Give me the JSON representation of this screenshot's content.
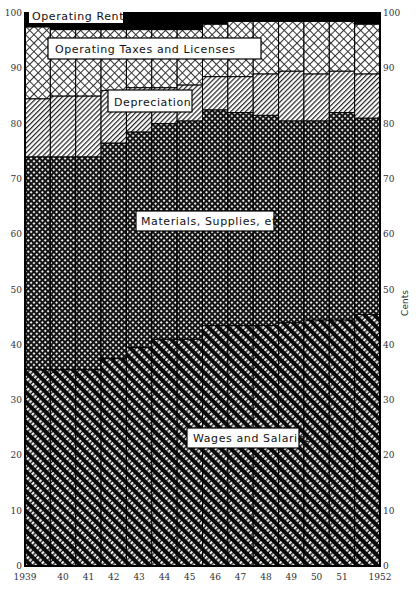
{
  "chart_data": {
    "type": "bar",
    "stacked": true,
    "title": "",
    "xlabel": "",
    "ylabel": "Cents",
    "ylim": [
      0,
      100
    ],
    "yticks": [
      0,
      10,
      20,
      30,
      40,
      50,
      60,
      70,
      80,
      90,
      100
    ],
    "categories": [
      "1939",
      "40",
      "41",
      "42",
      "43",
      "44",
      "45",
      "46",
      "47",
      "48",
      "49",
      "50",
      "51",
      "1952"
    ],
    "grid": false,
    "legend": "inline labels",
    "series": [
      {
        "name": "Wages and Salaries",
        "values": [
          35.5,
          35.5,
          35.5,
          37.5,
          39.5,
          41,
          41,
          43.5,
          43.5,
          43.5,
          44,
          44.5,
          44.5,
          45.5
        ]
      },
      {
        "name": "Materials, Supplies, etc.",
        "values": [
          38.5,
          38.5,
          38.5,
          39,
          39,
          39,
          39.5,
          39,
          38.5,
          38,
          36.5,
          36,
          37.5,
          35.5
        ]
      },
      {
        "name": "Depreciation",
        "values": [
          10.5,
          11,
          11,
          9.5,
          8,
          6.5,
          6.5,
          6,
          6.5,
          7.5,
          9,
          8.5,
          7.5,
          8
        ]
      },
      {
        "name": "Operating Taxes and Licenses",
        "values": [
          13,
          12,
          12,
          11,
          10.5,
          10.5,
          10,
          9.5,
          10,
          9.5,
          9,
          9.5,
          9,
          9
        ]
      },
      {
        "name": "Operating Rents",
        "values": [
          2.5,
          3,
          3,
          3,
          3,
          3,
          3,
          2,
          1.5,
          1.5,
          1.5,
          1.5,
          1.5,
          2
        ]
      }
    ]
  },
  "labels": {
    "rents": "Operating Rents",
    "taxes": "Operating Taxes and Licenses",
    "depreciation": "Depreciation",
    "materials": "Materials, Supplies, etc.",
    "wages": "Wages and Salaries",
    "axis_right": "Cents"
  }
}
